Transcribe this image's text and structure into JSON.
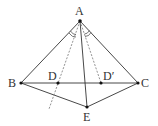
{
  "diagram": {
    "type": "geometry",
    "stroke_color": "#333333",
    "dash_color": "#777777",
    "points": {
      "A": {
        "label": "A",
        "x": 80,
        "y": 21
      },
      "B": {
        "label": "B",
        "x": 21,
        "y": 83
      },
      "C": {
        "label": "C",
        "x": 138,
        "y": 83
      },
      "D": {
        "label": "D",
        "x": 58,
        "y": 83
      },
      "Dp": {
        "label": "D′",
        "x": 101,
        "y": 83
      },
      "E": {
        "label": "E",
        "x": 87,
        "y": 107
      }
    },
    "segments_solid": [
      "AB",
      "AC",
      "BC",
      "BE",
      "CE",
      "AE"
    ],
    "segments_dashed": [
      "AD (extended)",
      "AD′"
    ],
    "angle_marks": "equal angles ∠BAD and ∠D′AC marked at A"
  }
}
